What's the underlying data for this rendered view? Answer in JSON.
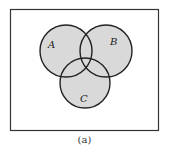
{
  "diagram": {
    "type": "venn",
    "sets": [
      {
        "label": "A",
        "cx": 66,
        "cy": 51,
        "r": 26
      },
      {
        "label": "B",
        "cx": 106,
        "cy": 51,
        "r": 26
      },
      {
        "label": "C",
        "cx": 85,
        "cy": 83,
        "r": 25
      }
    ],
    "fill_color": "#d9d9d9",
    "stroke_color": "#222222",
    "universe": {
      "x": 10,
      "y": 9,
      "width": 149,
      "height": 122
    }
  },
  "caption": "(a)"
}
